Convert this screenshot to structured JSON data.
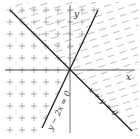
{
  "diagram": {
    "type": "linear-inequality-regions",
    "axes": {
      "x_label": "x",
      "y_label": "y",
      "color": "#555555"
    },
    "lines": [
      {
        "equation": "x + y = 0",
        "label": "x + y = 0",
        "color": "#222222"
      },
      {
        "equation": "y - 2x = 0",
        "label": "y − 2x = 0",
        "color": "#222222"
      }
    ],
    "regions": [
      {
        "name": "dotted-region",
        "pattern": "plus-dots",
        "description": "left side, below x+y=0 line and left of y-2x=0"
      },
      {
        "name": "hatched-region",
        "pattern": "dashes",
        "description": "right side, above x+y=0 line and right of y-2x=0"
      },
      {
        "name": "overlap-region",
        "pattern": "dashes+plus-dots",
        "description": "top wedge between x+y=0 and y-2x=0"
      }
    ],
    "colors": {
      "background": "#ffffff",
      "pattern": "#9a9a9a"
    }
  }
}
